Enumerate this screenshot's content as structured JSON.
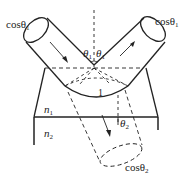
{
  "figure": {
    "labels": {
      "incident_area": {
        "text": "cosθ",
        "sub": "1"
      },
      "reflected_area": {
        "text": "cosθ",
        "sub": "1"
      },
      "refracted_area": {
        "text": "cosθ",
        "sub": "2"
      },
      "incident_angle": {
        "text": "θ",
        "sub": "1"
      },
      "reflected_angle": {
        "text": "θ",
        "sub": "1"
      },
      "refracted_angle": {
        "text": "θ",
        "sub": "2"
      },
      "unit_area": {
        "text": "1"
      },
      "medium_upper": {
        "text": "n",
        "sub": "1"
      },
      "medium_lower": {
        "text": "n",
        "sub": "2"
      }
    },
    "colors": {
      "stroke": "#222222",
      "background": "#ffffff"
    }
  }
}
